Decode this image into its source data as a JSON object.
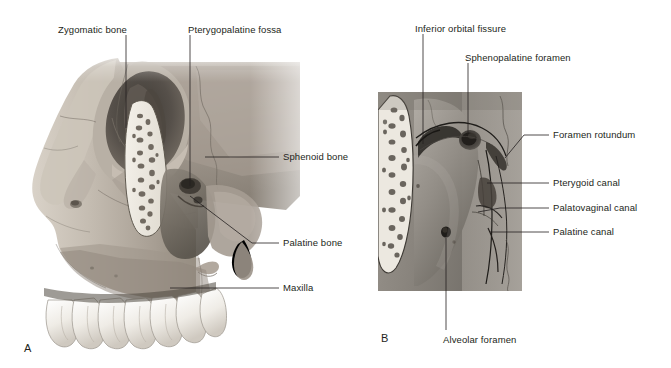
{
  "figure": {
    "background_color": "#ffffff",
    "text_color": "#231f20",
    "panels": [
      {
        "letter": "A",
        "letter_pos": {
          "x": 24,
          "y": 342
        },
        "description": "Lateral view of skull showing zygomatic bone, orbit, maxilla, sphenoid and pterygopalatine fossa with upper teeth",
        "image_box": {
          "x": 10,
          "y": 50,
          "w": 300,
          "h": 300
        }
      },
      {
        "letter": "B",
        "letter_pos": {
          "x": 381,
          "y": 332
        },
        "description": "Magnified view of pterygopalatine fossa region",
        "image_box": {
          "x": 378,
          "y": 92,
          "w": 144,
          "h": 199
        }
      }
    ],
    "labels": [
      {
        "id": "zygomatic-bone",
        "text": "Zygomatic bone",
        "x": 58,
        "y": 24,
        "anchor": "start",
        "panel": "A"
      },
      {
        "id": "pterygopalatine-fossa",
        "text": "Pterygopalatine fossa",
        "x": 188,
        "y": 24,
        "anchor": "start",
        "panel": "A"
      },
      {
        "id": "sphenoid-bone",
        "text": "Sphenoid bone",
        "x": 283,
        "y": 156,
        "anchor": "start",
        "panel": "A"
      },
      {
        "id": "palatine-bone",
        "text": "Palatine bone",
        "x": 283,
        "y": 238,
        "anchor": "start",
        "panel": "A"
      },
      {
        "id": "maxilla",
        "text": "Maxilla",
        "x": 283,
        "y": 283,
        "anchor": "start",
        "panel": "A"
      },
      {
        "id": "inferior-orbital-fissure",
        "text": "Inferior orbital fissure",
        "x": 415,
        "y": 23,
        "anchor": "start",
        "panel": "B"
      },
      {
        "id": "sphenopalatine-foramen",
        "text": "Sphenopalatine foramen",
        "x": 465,
        "y": 52,
        "anchor": "start",
        "panel": "B"
      },
      {
        "id": "foramen-rotundum",
        "text": "Foramen rotundum",
        "x": 553,
        "y": 130,
        "anchor": "start",
        "panel": "B"
      },
      {
        "id": "pterygoid-canal",
        "text": "Pterygoid canal",
        "x": 553,
        "y": 178,
        "anchor": "start",
        "panel": "B"
      },
      {
        "id": "palatovaginal-canal",
        "text": "Palatovaginal canal",
        "x": 553,
        "y": 203,
        "anchor": "start",
        "panel": "B"
      },
      {
        "id": "palatine-canal",
        "text": "Palatine canal",
        "x": 553,
        "y": 227,
        "anchor": "start",
        "panel": "B"
      },
      {
        "id": "alveolar-foramen",
        "text": "Alveolar foramen",
        "x": 443,
        "y": 334,
        "anchor": "start",
        "panel": "B"
      }
    ]
  }
}
